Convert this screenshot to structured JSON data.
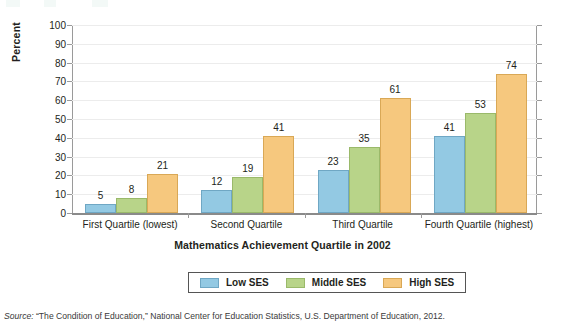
{
  "chart_data": {
    "type": "bar",
    "title": "",
    "xlabel": "Mathematics Achievement Quartile in 2002",
    "ylabel": "Percent",
    "ylim": [
      0,
      100
    ],
    "ytick_labels": [
      "100",
      "90",
      "80",
      "70",
      "60",
      "50",
      "40",
      "30",
      "20",
      "10",
      "0"
    ],
    "ytick_values": [
      100,
      90,
      80,
      70,
      60,
      50,
      40,
      30,
      20,
      10,
      0
    ],
    "grid": true,
    "legend_position": "bottom",
    "categories": [
      "First Quartile (lowest)",
      "Second Quartile",
      "Third Quartile",
      "Fourth Quartile (highest)"
    ],
    "series": [
      {
        "name": "Low SES",
        "color": "#93c9e3",
        "values": [
          5,
          12,
          23,
          41
        ]
      },
      {
        "name": "Middle SES",
        "color": "#b8d489",
        "values": [
          8,
          19,
          35,
          53
        ]
      },
      {
        "name": "High SES",
        "color": "#f6c87e",
        "values": [
          21,
          41,
          61,
          74
        ]
      }
    ]
  },
  "legend": {
    "items": [
      {
        "label": "Low SES",
        "swatch": "low"
      },
      {
        "label": "Middle SES",
        "swatch": "middle"
      },
      {
        "label": "High SES",
        "swatch": "high"
      }
    ]
  },
  "source": {
    "prefix": "Source:",
    "text": " “The Condition of Education,” National Center for Education Statistics, U.S. Department of Education, 2012."
  }
}
